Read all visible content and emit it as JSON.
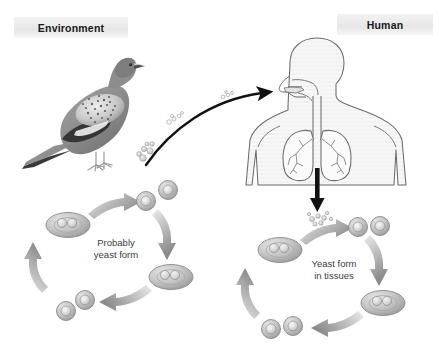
{
  "figure": {
    "background_color": "#ffffff",
    "width": 444,
    "height": 349
  },
  "labels": {
    "environment": "Environment",
    "human": "Human",
    "band_background": "#ebebeb",
    "text_color": "#1a1a1a"
  },
  "annotations": {
    "left_cycle": "Probably\nyeast form",
    "left_cycle_line1": "Probably",
    "left_cycle_line2": "yeast form",
    "right_cycle": "Yeast form\nin tissues",
    "right_cycle_line1": "Yeast form",
    "right_cycle_line2": "in tissues",
    "text_color": "#3d3d3d"
  },
  "illustrations": {
    "bird": {
      "name": "pigeon",
      "style": "grayscale photographic illustration",
      "body_color": "#8e8e8e",
      "wing_color": "#6f6f6f",
      "speckle_color": "#d8d8d8"
    },
    "human": {
      "name": "human-torso-respiratory-system",
      "style": "line drawing of head, neck, torso, trachea and lungs",
      "outline_color": "#5a5a5a",
      "fill_color": "#f6f6f6"
    }
  },
  "arrows": {
    "inhalation": {
      "name": "inhalation-arrow",
      "description": "curved black arrow from environment spores to human mouth",
      "color": "#111111"
    },
    "dissemination": {
      "name": "dissemination-arrow",
      "description": "straight black arrow downward from lungs to tissue yeast cycle",
      "color": "#111111"
    },
    "cycle_arrow_color": "#8c8c8c"
  },
  "cells": {
    "spore_color": "#c9c9c9",
    "yeast_fill": "#bdbdbd",
    "yeast_stroke": "#8a8a8a",
    "nucleus_color": "#e4e4e4",
    "left_cycle_stages": [
      "single yeast cell",
      "budding yeast cell",
      "separating daughter cells",
      "dividing yeast cell"
    ],
    "right_cycle_stages": [
      "single yeast cell",
      "budding yeast cell",
      "separating daughter cells",
      "dividing yeast cell"
    ],
    "spore_cluster_count": 2
  }
}
